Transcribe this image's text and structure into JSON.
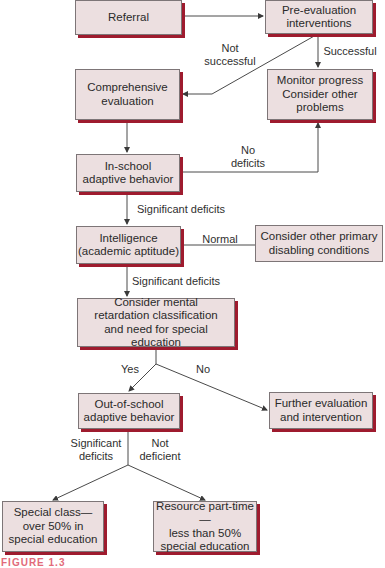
{
  "diagram": {
    "type": "flowchart",
    "colors": {
      "box_fill": "#ecdfe0",
      "box_border": "#7d7577",
      "box_shadow": "#9e1b2e",
      "line": "#4a4a4a"
    },
    "nodes": {
      "referral": "Referral",
      "pre_evaluation": "Pre-evaluation\ninterventions",
      "comprehensive_evaluation": "Comprehensive\nevaluation",
      "monitor_progress": "Monitor progress\nConsider other\nproblems",
      "in_school_adaptive": "In-school\nadaptive  behavior",
      "intelligence": "Intelligence\n(academic aptitude)",
      "other_primary": "Consider other primary\ndisabling conditions",
      "mental_retardation": "Consider mental\nretardation classification\nand need for special education",
      "out_of_school_adaptive": "Out-of-school\nadaptive behavior",
      "further_evaluation": "Further evaluation\nand intervention",
      "special_class": "Special class—\nover 50% in\nspecial education",
      "resource_part_time": "Resource part-time—\nless than 50%\nspecial education"
    },
    "edge_labels": {
      "not_successful": "Not\nsuccessful",
      "successful": "Successful",
      "no_deficits": "No\ndeficits",
      "significant_deficits_1": "Significant deficits",
      "normal": "Normal",
      "significant_deficits_2": "Significant deficits",
      "yes": "Yes",
      "no": "No",
      "significant_deficits_3": "Significant\ndeficits",
      "not_deficient": "Not\ndeficient"
    },
    "caption": "FIGURE 1.3"
  }
}
